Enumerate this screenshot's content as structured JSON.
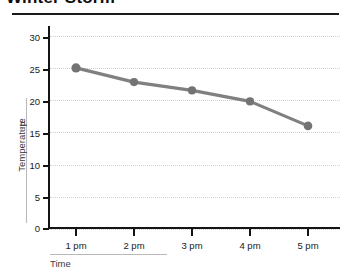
{
  "title": "Winter Storm",
  "chart_data": {
    "type": "line",
    "title": "Winter Storm",
    "xlabel": "Time",
    "ylabel": "Temperature",
    "yunit": "°F",
    "categories": [
      "1 pm",
      "2 pm",
      "3 pm",
      "4 pm",
      "5 pm"
    ],
    "values": [
      25,
      22.8,
      21.5,
      19.8,
      16
    ],
    "yticks": [
      0,
      5,
      10,
      15,
      20,
      25,
      30
    ],
    "ylim": [
      0,
      31.5
    ],
    "grid": true,
    "legend": false,
    "series_color": "#808080",
    "marker": "circle"
  },
  "axis": {
    "y_tick_labels": [
      "30",
      "25",
      "20",
      "15",
      "10",
      "5",
      "0"
    ],
    "x_tick_labels": [
      "1 pm",
      "2 pm",
      "3 pm",
      "4 pm",
      "5 pm"
    ]
  },
  "colors": {
    "line": "#808080",
    "marker": "#737373",
    "axis": "#141414",
    "grid": "#d2d2d2",
    "rule": "#b9b9b9",
    "text": "#1a1a1a"
  }
}
